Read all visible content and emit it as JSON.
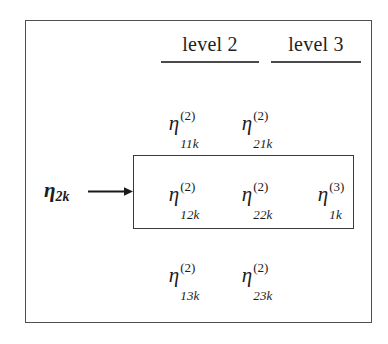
{
  "figure": {
    "headers": [
      {
        "label": "level 2"
      },
      {
        "label": "level 3"
      }
    ],
    "vector_label": {
      "symbol": "η",
      "subscript": "2k"
    },
    "rows": [
      {
        "highlighted": false,
        "cells": [
          {
            "symbol": "η",
            "superscript": "(2)",
            "subscript": "11k"
          },
          {
            "symbol": "η",
            "superscript": "(2)",
            "subscript": "21k"
          }
        ]
      },
      {
        "highlighted": true,
        "cells": [
          {
            "symbol": "η",
            "superscript": "(2)",
            "subscript": "12k"
          },
          {
            "symbol": "η",
            "superscript": "(2)",
            "subscript": "22k"
          },
          {
            "symbol": "η",
            "superscript": "(3)",
            "subscript": "1k"
          }
        ]
      },
      {
        "highlighted": false,
        "cells": [
          {
            "symbol": "η",
            "superscript": "(2)",
            "subscript": "13k"
          },
          {
            "symbol": "η",
            "superscript": "(2)",
            "subscript": "23k"
          }
        ]
      }
    ],
    "colors": {
      "outer_border": "#4f4f52",
      "inner_border": "#3a3a3d",
      "rule": "#4a4a4d",
      "text": "#1c1c1c",
      "background": "#ffffff",
      "arrow": "#1a1a1a"
    }
  }
}
